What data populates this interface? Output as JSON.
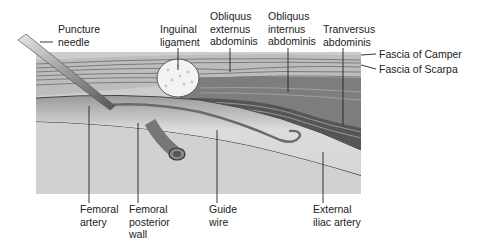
{
  "diagram": {
    "type": "anatomical-cross-section",
    "labels_top": [
      {
        "id": "puncture-needle",
        "text": "Puncture\nneedle"
      },
      {
        "id": "inguinal-ligament",
        "text": "Inguinal\nligament"
      },
      {
        "id": "obliquus-externus",
        "text": "Obliquus\nexternus\nabdominis"
      },
      {
        "id": "obliquus-internus",
        "text": "Obliquus\ninternus\nabdominis"
      },
      {
        "id": "tranversus",
        "text": "Tranversus\nabdominis"
      }
    ],
    "labels_right": [
      {
        "id": "fascia-camper",
        "text": "Fascia of Camper"
      },
      {
        "id": "fascia-scarpa",
        "text": "Fascia of Scarpa"
      }
    ],
    "labels_bottom": [
      {
        "id": "femoral-artery",
        "text": "Femoral\nartery"
      },
      {
        "id": "femoral-posterior-wall",
        "text": "Femoral\nposterior\nwall"
      },
      {
        "id": "guide-wire",
        "text": "Guide\nwire"
      },
      {
        "id": "external-iliac-artery",
        "text": "External\niliac artery"
      }
    ],
    "colors": {
      "skin_layers": "#b8b8b8",
      "muscle": "#6e6e6e",
      "muscle_dark": "#555555",
      "vessel_lumen": "#d8d8d8",
      "deep_tissue": "#cfcfcf",
      "ligament": "#f2f2f2",
      "line": "#222222"
    }
  }
}
